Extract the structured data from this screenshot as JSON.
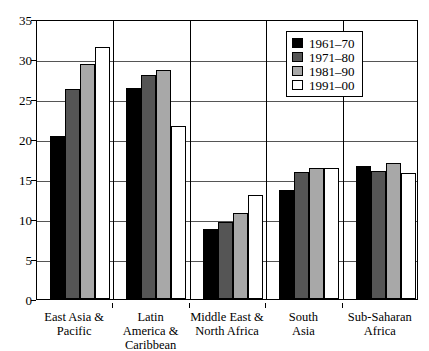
{
  "chart_data": {
    "type": "bar",
    "title": "",
    "subtitle": "",
    "xlabel": "",
    "ylabel": "",
    "ylim": [
      0,
      35
    ],
    "ytick_step": 5,
    "yticks": [
      35,
      30,
      25,
      20,
      15,
      10,
      5,
      0
    ],
    "grid": true,
    "legend_position": "top-right",
    "categories": [
      "East Asia & Pacific",
      "Latin America & Caribbean",
      "Middle East & North Africa",
      "South Asia",
      "Sub-Saharan Africa"
    ],
    "series": [
      {
        "name": "1961–70",
        "color": "#000000",
        "values": [
          20.4,
          26.4,
          8.8,
          13.6,
          16.6
        ]
      },
      {
        "name": "1971–80",
        "color": "#555555",
        "values": [
          26.3,
          28.0,
          9.6,
          15.9,
          16.0
        ]
      },
      {
        "name": "1981–90",
        "color": "#a8a8a8",
        "values": [
          29.4,
          28.6,
          10.7,
          16.4,
          17.0
        ]
      },
      {
        "name": "1991–00",
        "color": "#ffffff",
        "values": [
          31.5,
          21.6,
          13.0,
          16.4,
          15.7
        ]
      }
    ]
  },
  "axis": {
    "y_tick_labels": [
      "35",
      "30",
      "25",
      "20",
      "15",
      "10",
      "5",
      "0"
    ],
    "x_group_labels": [
      "East Asia &\nPacific",
      "Latin\nAmerica &\nCaribbean",
      "Middle East &\nNorth Africa",
      "South\nAsia",
      "Sub-Saharan\nAfrica"
    ]
  },
  "legend": {
    "items": [
      {
        "label": "1961–70",
        "color": "#000000"
      },
      {
        "label": "1971–80",
        "color": "#555555"
      },
      {
        "label": "1981–90",
        "color": "#a8a8a8"
      },
      {
        "label": "1991–00",
        "color": "#ffffff"
      }
    ]
  }
}
